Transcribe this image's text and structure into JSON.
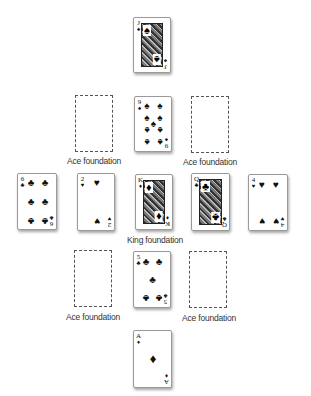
{
  "game": {
    "title": "Solitaire layout",
    "colors": {
      "card_border": "#9a9a9a",
      "slot_border": "#555555",
      "ink": "#111111",
      "label": "#333333"
    }
  },
  "stock_top": {
    "rank": "J",
    "suit": "♠",
    "type": "face"
  },
  "foundations": {
    "ace_top_left": {
      "label": "Ace foundation",
      "empty": true
    },
    "ace_top_right": {
      "label": "Ace foundation",
      "empty": true
    },
    "ace_bottom_left": {
      "label": "Ace foundation",
      "empty": true
    },
    "ace_bottom_right": {
      "label": "Ace foundation",
      "empty": true
    },
    "king_center": {
      "label": "King foundation",
      "rank": "K",
      "suit": "♦"
    }
  },
  "cards": {
    "top_center": {
      "rank": "9",
      "suit": "♠"
    },
    "middle_far_left": {
      "rank": "6",
      "suit": "♣"
    },
    "middle_left": {
      "rank": "2",
      "suit": "♥"
    },
    "middle_right": {
      "rank": "Q",
      "suit": "♣"
    },
    "middle_far_right": {
      "rank": "4",
      "suit": "♥"
    },
    "bottom_center": {
      "rank": "5",
      "suit": "♣"
    },
    "waste_bottom": {
      "rank": "A",
      "suit": "♦"
    }
  }
}
